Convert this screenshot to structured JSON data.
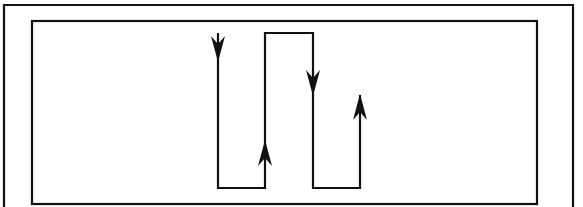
{
  "diagram": {
    "type": "flow-path",
    "stroke_color": "#111111",
    "background_color": "#ffffff",
    "outer_frame": {
      "x1": 4,
      "y1": 5,
      "x2": 573,
      "y2": 207,
      "sides": [
        "left",
        "top",
        "right"
      ]
    },
    "inner_frame": {
      "x": 32,
      "y": 21,
      "width": 505,
      "height": 183
    },
    "path": {
      "points": [
        [
          218,
          33
        ],
        [
          218,
          188
        ],
        [
          265,
          188
        ],
        [
          265,
          33
        ],
        [
          313,
          33
        ],
        [
          313,
          188
        ],
        [
          360,
          188
        ],
        [
          360,
          95
        ]
      ]
    },
    "arrows": [
      {
        "name": "arrow-down-1",
        "direction": "down",
        "x": 218,
        "tip_y": 62
      },
      {
        "name": "arrow-up-1",
        "direction": "up",
        "x": 265,
        "tip_y": 140
      },
      {
        "name": "arrow-down-2",
        "direction": "down",
        "x": 313,
        "tip_y": 96
      },
      {
        "name": "arrow-up-2",
        "direction": "up",
        "x": 360,
        "tip_y": 94
      }
    ]
  }
}
